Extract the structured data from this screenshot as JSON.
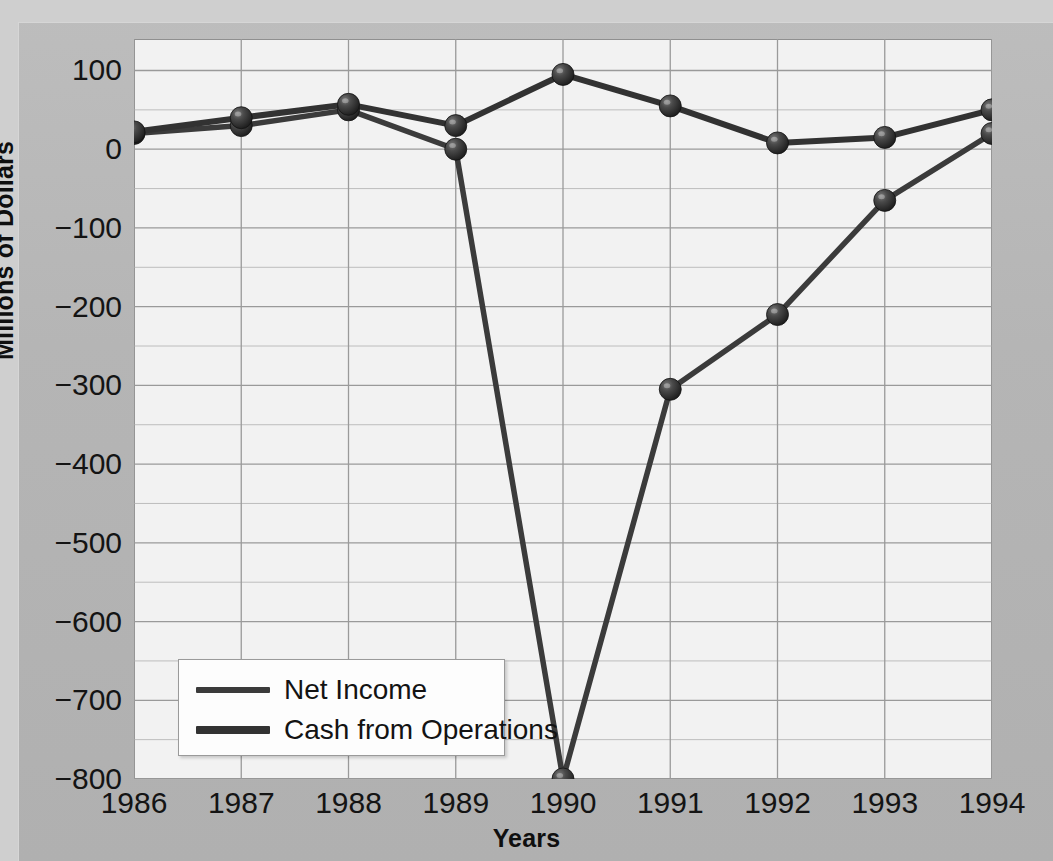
{
  "chart_data": {
    "type": "line",
    "title": "",
    "xlabel": "Years",
    "ylabel": "Millions of Dollars",
    "categories": [
      "1986",
      "1987",
      "1988",
      "1989",
      "1990",
      "1991",
      "1992",
      "1993",
      "1994"
    ],
    "x": [
      1986,
      1987,
      1988,
      1989,
      1990,
      1991,
      1992,
      1993,
      1994
    ],
    "xlim": [
      1986,
      1994
    ],
    "ylim": [
      -800,
      140
    ],
    "ytick_labels": [
      "100",
      "0",
      "−100",
      "−200",
      "−300",
      "−400",
      "−500",
      "−600",
      "−700",
      "−800"
    ],
    "yticks": [
      100,
      0,
      -100,
      -200,
      -300,
      -400,
      -500,
      -600,
      -700,
      -800
    ],
    "minor_ytick_step": 50,
    "grid": true,
    "grid_color": "#a8a8a8",
    "plot_background": "#f2f2f2",
    "figure_background": "#b5b5b5",
    "legend_position": "lower left inside axes",
    "series": [
      {
        "name": "Net Income",
        "color": "#3b3b3b",
        "marker": "sphere",
        "values": [
          20,
          30,
          50,
          0,
          -800,
          -305,
          -210,
          -65,
          20
        ]
      },
      {
        "name": "Cash from Operations",
        "color": "#323232",
        "marker": "sphere",
        "values": [
          22,
          40,
          57,
          30,
          95,
          55,
          8,
          15,
          50
        ]
      }
    ]
  },
  "legend": {
    "items": [
      {
        "label": "Net Income"
      },
      {
        "label": "Cash from Operations"
      }
    ]
  },
  "axes": {
    "y_axis_title": "Millions of Dollars",
    "x_axis_title": "Years"
  }
}
